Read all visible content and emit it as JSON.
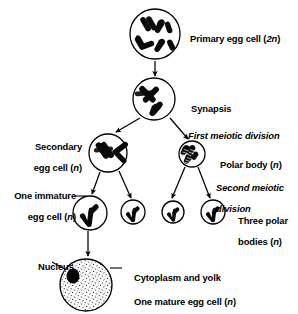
{
  "diagram": {
    "background_color": "#ffffff",
    "ink_color": "#000000",
    "labels": {
      "primary_egg_cell": "Primary egg cell (2n)",
      "synapsis": "Synapsis",
      "first_meiotic_division": "First meiotic division",
      "secondary_egg_cell_line1": "Secondary",
      "secondary_egg_cell_line2": "egg cell (n)",
      "polar_body": "Polar body (n)",
      "second_meiotic_division_line1": "Second meiotic",
      "second_meiotic_division_line2": "division",
      "one_immature_egg_cell_line1": "One immature",
      "one_immature_egg_cell_line2": "egg cell (n)",
      "three_polar_bodies_line1": "Three polar",
      "three_polar_bodies_line2": "bodies (n)",
      "nucleus": "Nucleus",
      "cytoplasm_and_yolk": "Cytoplasm and yolk",
      "one_mature_egg_cell": "One mature egg cell (n)"
    },
    "cells": [
      {
        "name": "primary-egg-cell",
        "cx": 155,
        "cy": 34,
        "r": 25,
        "label": "Primary egg cell (2n)",
        "ploidy": "2n"
      },
      {
        "name": "synapsis-cell",
        "cx": 154,
        "cy": 99,
        "r": 21,
        "label": "Synapsis",
        "ploidy": ""
      },
      {
        "name": "secondary-egg-cell",
        "cx": 108,
        "cy": 153,
        "r": 19,
        "label": "Secondary egg cell (n)",
        "ploidy": "n"
      },
      {
        "name": "polar-body-cell",
        "cx": 192,
        "cy": 154,
        "r": 13,
        "label": "Polar body (n)",
        "ploidy": "n"
      },
      {
        "name": "immature-egg-cell",
        "cx": 90,
        "cy": 213,
        "r": 17,
        "label": "One immature egg cell (n)",
        "ploidy": "n"
      },
      {
        "name": "polar-body-1",
        "cx": 133,
        "cy": 212,
        "r": 12,
        "label": "polar body",
        "ploidy": "n"
      },
      {
        "name": "polar-body-2",
        "cx": 173,
        "cy": 212,
        "r": 11,
        "label": "polar body",
        "ploidy": "n"
      },
      {
        "name": "polar-body-3",
        "cx": 213,
        "cy": 212,
        "r": 12,
        "label": "polar body",
        "ploidy": "n"
      },
      {
        "name": "mature-egg-cell",
        "cx": 86,
        "cy": 285,
        "r": 26,
        "label": "One mature egg cell (n)",
        "ploidy": "n"
      }
    ],
    "nucleus": {
      "name": "nucleus-dot",
      "cx": 73,
      "cy": 276,
      "rx": 6.5,
      "ry": 7.5
    },
    "arrows": [
      {
        "name": "arrow-primary-to-synapsis",
        "from": "primary-egg-cell",
        "to": "synapsis-cell"
      },
      {
        "name": "arrow-synapsis-to-secondary",
        "from": "synapsis-cell",
        "to": "secondary-egg-cell"
      },
      {
        "name": "arrow-synapsis-to-polar-body",
        "from": "synapsis-cell",
        "to": "polar-body-cell"
      },
      {
        "name": "arrow-secondary-to-immature",
        "from": "secondary-egg-cell",
        "to": "immature-egg-cell"
      },
      {
        "name": "arrow-secondary-to-polar-body-1",
        "from": "secondary-egg-cell",
        "to": "polar-body-1"
      },
      {
        "name": "arrow-polar-body-to-polar-body-2",
        "from": "polar-body-cell",
        "to": "polar-body-2"
      },
      {
        "name": "arrow-polar-body-to-polar-body-3",
        "from": "polar-body-cell",
        "to": "polar-body-3"
      },
      {
        "name": "arrow-immature-to-mature",
        "from": "immature-egg-cell",
        "to": "mature-egg-cell"
      }
    ],
    "leaders": [
      {
        "name": "leader-nucleus",
        "label": "Nucleus"
      },
      {
        "name": "leader-cytoplasm",
        "label": "Cytoplasm and yolk"
      },
      {
        "name": "leader-immature-egg-cell",
        "label": "One immature egg cell (n)"
      },
      {
        "name": "leader-secondary-egg-cell",
        "label": "Secondary egg cell (n)"
      }
    ]
  }
}
